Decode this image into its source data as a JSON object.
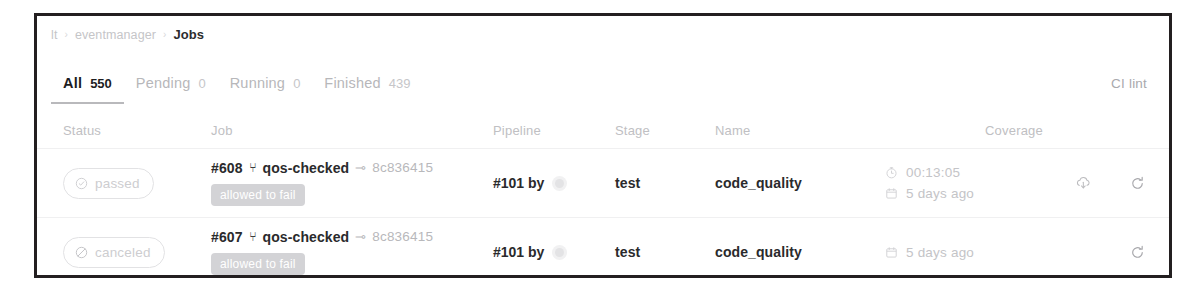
{
  "breadcrumb": {
    "items": [
      "lt",
      "eventmanager",
      "Jobs"
    ],
    "separator": "›",
    "item0": "lt",
    "item1": "eventmanager",
    "item2": "Jobs"
  },
  "tabs": {
    "items": [
      {
        "label": "All",
        "count": "550",
        "active": true
      },
      {
        "label": "Pending",
        "count": "0",
        "active": false
      },
      {
        "label": "Running",
        "count": "0",
        "active": false
      },
      {
        "label": "Finished",
        "count": "439",
        "active": false
      }
    ],
    "ci_lint_label": "CI lint"
  },
  "table": {
    "headers": {
      "status": "Status",
      "job": "Job",
      "pipeline": "Pipeline",
      "stage": "Stage",
      "name": "Name",
      "coverage": "Coverage"
    },
    "rows": [
      {
        "status": {
          "label": "passed",
          "icon": "check-circle-icon"
        },
        "job": {
          "id": "#608",
          "branch_icon": "⑂",
          "branch": "qos-checked",
          "commit_icon": "⊸",
          "sha": "8c836415",
          "badge": "allowed to fail"
        },
        "pipeline": {
          "label": "#101 by",
          "avatar": "user-avatar"
        },
        "stage": "test",
        "name": "code_quality",
        "meta": [
          {
            "icon": "timer-icon",
            "text": "00:13:05"
          },
          {
            "icon": "calendar-icon",
            "text": "5 days ago"
          }
        ],
        "actions": [
          "download-icon",
          "retry-icon"
        ]
      },
      {
        "status": {
          "label": "canceled",
          "icon": "slash-circle-icon"
        },
        "job": {
          "id": "#607",
          "branch_icon": "⑂",
          "branch": "qos-checked",
          "commit_icon": "⊸",
          "sha": "8c836415",
          "badge": "allowed to fail"
        },
        "pipeline": {
          "label": "#101 by",
          "avatar": "user-avatar"
        },
        "stage": "test",
        "name": "code_quality",
        "meta": [
          {
            "icon": "calendar-icon",
            "text": "5 days ago"
          }
        ],
        "actions": [
          "retry-icon"
        ]
      }
    ]
  },
  "colors": {
    "card_border": "#231f20",
    "text_primary": "#2a2a2c",
    "text_muted": "#c0c0c3",
    "badge_bg": "#d3d3d6",
    "row_divider": "#f0f0f1"
  }
}
